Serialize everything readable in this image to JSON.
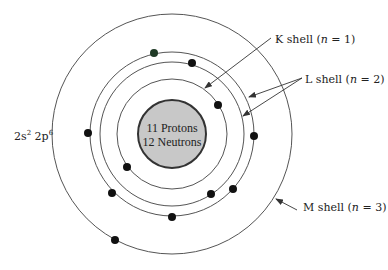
{
  "diagram": {
    "center": [
      172,
      134
    ],
    "nucleus": {
      "radius": 34,
      "fill": "#c8c8c8",
      "stroke": "#333333",
      "line1": "11 Protons",
      "line2": "12 Neutrons"
    },
    "shells": [
      {
        "name": "K",
        "radius": 55
      },
      {
        "name": "L-inner",
        "radius": 72
      },
      {
        "name": "L-outer",
        "radius": 82
      },
      {
        "name": "M",
        "radius": 120
      }
    ],
    "electrons": [
      {
        "x": 154,
        "y": 53,
        "color": "#1f3a26"
      },
      {
        "x": 192,
        "y": 63,
        "color": "#111111"
      },
      {
        "x": 218,
        "y": 105,
        "color": "#111111"
      },
      {
        "x": 88,
        "y": 133,
        "color": "#111111"
      },
      {
        "x": 254,
        "y": 136,
        "color": "#111111"
      },
      {
        "x": 127,
        "y": 167,
        "color": "#111111"
      },
      {
        "x": 112,
        "y": 193,
        "color": "#111111"
      },
      {
        "x": 211,
        "y": 194,
        "color": "#111111"
      },
      {
        "x": 233,
        "y": 189,
        "color": "#111111"
      },
      {
        "x": 172,
        "y": 217,
        "color": "#111111"
      },
      {
        "x": 115,
        "y": 240,
        "color": "#111111"
      }
    ],
    "labels": {
      "k_shell": {
        "prefix": "K shell (",
        "var": "n",
        "suffix": " = 1)"
      },
      "l_shell": {
        "prefix": "L shell (",
        "var": "n",
        "suffix": " = 2)"
      },
      "m_shell": {
        "prefix": "M shell (",
        "var": "n",
        "suffix": " = 3)"
      },
      "config": {
        "s": "2s",
        "s_exp": "2",
        "p": " 2p",
        "p_exp": "6"
      }
    },
    "arrows": [
      {
        "from": [
          271,
          38
        ],
        "to": [
          205,
          88
        ]
      },
      {
        "from": [
          302,
          78
        ],
        "to": [
          249,
          97
        ]
      },
      {
        "from": [
          302,
          78
        ],
        "to": [
          243,
          116
        ]
      },
      {
        "from": [
          297,
          210
        ],
        "to": [
          276,
          199
        ]
      }
    ]
  }
}
